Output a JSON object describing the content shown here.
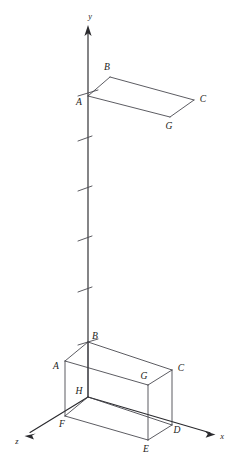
{
  "figure": {
    "background_color": "#ffffff",
    "line_color": "#3f3f46",
    "axis_color": "#2a2a2e",
    "label_color": "#1c1c20",
    "width": 243,
    "height": 469
  },
  "axes": [
    {
      "id": "y",
      "label": "y",
      "label_x": 90,
      "label_y": 17,
      "x1": 88,
      "y1": 27,
      "x2": 88,
      "y2": 397,
      "arrow": "up",
      "arrow_x": 88,
      "arrow_y": 27
    },
    {
      "id": "x",
      "label": "x",
      "label_x": 222,
      "label_y": 437,
      "x1": 88,
      "y1": 397,
      "x2": 214,
      "y2": 434,
      "arrow": "right-down",
      "arrow_x": 214,
      "arrow_y": 434
    },
    {
      "id": "z",
      "label": "z",
      "label_x": 17,
      "label_y": 442,
      "x1": 88,
      "y1": 397,
      "x2": 26,
      "y2": 435,
      "arrow": "left-down",
      "arrow_x": 26,
      "arrow_y": 435
    }
  ],
  "y_axis_ticks": [
    {
      "index": 1,
      "y": 93,
      "x1": 78,
      "y1": 96,
      "x2": 98,
      "y2": 90
    },
    {
      "index": 2,
      "y": 138,
      "x1": 78,
      "y1": 141,
      "x2": 92,
      "y2": 136
    },
    {
      "index": 3,
      "y": 188,
      "x1": 78,
      "y1": 191,
      "x2": 92,
      "y2": 186
    },
    {
      "index": 4,
      "y": 238,
      "x1": 78,
      "y1": 241,
      "x2": 92,
      "y2": 236
    },
    {
      "index": 5,
      "y": 289,
      "x1": 78,
      "y1": 292,
      "x2": 92,
      "y2": 287
    },
    {
      "index": 6,
      "y": 342,
      "x1": 78,
      "y1": 345,
      "x2": 98,
      "y2": 339
    }
  ],
  "top_parallelogram": {
    "name": "translated-top-face",
    "vertices": [
      {
        "id": "A",
        "x": 88,
        "y": 96,
        "label": "A",
        "label_x": 79,
        "label_y": 103
      },
      {
        "id": "B",
        "x": 110,
        "y": 77,
        "label": "B",
        "label_x": 107,
        "label_y": 68
      },
      {
        "id": "C",
        "x": 194,
        "y": 100,
        "label": "C",
        "label_x": 203,
        "label_y": 100
      },
      {
        "id": "G",
        "x": 170,
        "y": 117,
        "label": "G",
        "label_x": 169,
        "label_y": 127
      }
    ],
    "edges": [
      [
        "A",
        "B"
      ],
      [
        "B",
        "C"
      ],
      [
        "C",
        "G"
      ],
      [
        "G",
        "A"
      ]
    ]
  },
  "box": {
    "name": "rectangular-box",
    "vertices": [
      {
        "id": "A",
        "x": 65,
        "y": 361,
        "label": "A",
        "label_x": 56,
        "label_y": 367
      },
      {
        "id": "B",
        "x": 88,
        "y": 342,
        "label": "B",
        "label_x": 95,
        "label_y": 337
      },
      {
        "id": "C",
        "x": 172,
        "y": 370,
        "label": "C",
        "label_x": 181,
        "label_y": 369
      },
      {
        "id": "G",
        "x": 148,
        "y": 385,
        "label": "G",
        "label_x": 144,
        "label_y": 377
      },
      {
        "id": "H",
        "x": 88,
        "y": 397,
        "label": "H",
        "label_x": 79,
        "label_y": 392
      },
      {
        "id": "F",
        "x": 65,
        "y": 416,
        "label": "F",
        "label_x": 62,
        "label_y": 425
      },
      {
        "id": "D",
        "x": 172,
        "y": 425,
        "label": "D",
        "label_x": 177,
        "label_y": 431
      },
      {
        "id": "E",
        "x": 148,
        "y": 440,
        "label": "E",
        "label_x": 146,
        "label_y": 450
      }
    ],
    "edges": [
      [
        "A",
        "B"
      ],
      [
        "B",
        "C"
      ],
      [
        "C",
        "G"
      ],
      [
        "G",
        "A"
      ],
      [
        "H",
        "F"
      ],
      [
        "F",
        "E"
      ],
      [
        "E",
        "D"
      ],
      [
        "D",
        "H"
      ],
      [
        "A",
        "F"
      ],
      [
        "B",
        "H"
      ],
      [
        "C",
        "D"
      ],
      [
        "G",
        "E"
      ]
    ]
  }
}
